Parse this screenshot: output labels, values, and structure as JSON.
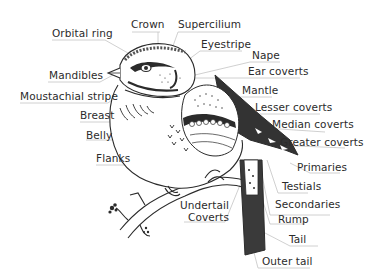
{
  "diagram": {
    "type": "bird-anatomy",
    "colors": {
      "ink": "#2b2b2b",
      "leader": "#bdbdbd",
      "background": "#ffffff"
    },
    "labels": [
      {
        "id": "crown",
        "text": "Crown"
      },
      {
        "id": "supercilium",
        "text": "Supercilium"
      },
      {
        "id": "orbital-ring",
        "text": "Orbital ring"
      },
      {
        "id": "eyestripe",
        "text": "Eyestripe"
      },
      {
        "id": "nape",
        "text": "Nape"
      },
      {
        "id": "ear-coverts",
        "text": "Ear coverts"
      },
      {
        "id": "mandibles",
        "text": "Mandibles"
      },
      {
        "id": "mantle",
        "text": "Mantle"
      },
      {
        "id": "moustachial-stripe",
        "text": "Moustachial stripe"
      },
      {
        "id": "lesser-coverts",
        "text": "Lesser coverts"
      },
      {
        "id": "breast",
        "text": "Breast"
      },
      {
        "id": "median-coverts",
        "text": "Median coverts"
      },
      {
        "id": "belly",
        "text": "Belly"
      },
      {
        "id": "greater-coverts",
        "text": "Greater coverts"
      },
      {
        "id": "flanks",
        "text": "Flanks"
      },
      {
        "id": "primaries",
        "text": "Primaries"
      },
      {
        "id": "testials",
        "text": "Testials"
      },
      {
        "id": "undertail-coverts-1",
        "text": "Undertail"
      },
      {
        "id": "undertail-coverts-2",
        "text": "Coverts"
      },
      {
        "id": "secondaries",
        "text": "Secondaries"
      },
      {
        "id": "rump",
        "text": "Rump"
      },
      {
        "id": "tail",
        "text": "Tail"
      },
      {
        "id": "outer-tail",
        "text": "Outer tail"
      }
    ]
  }
}
